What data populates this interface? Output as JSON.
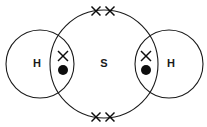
{
  "figure": {
    "molecule_formula": "H2S",
    "background_color": "#ffffff",
    "stroke_color": "#1a1a1a",
    "electron_color": "#0d0d0d",
    "width": 207,
    "height": 127
  },
  "atoms": [
    {
      "id": "hydrogen-left",
      "label": "H",
      "element": "H",
      "label_x": 37,
      "label_y": 63,
      "circle": {
        "cx": 40,
        "cy": 64,
        "r": 34
      }
    },
    {
      "id": "sulfur-center",
      "label": "S",
      "element": "S",
      "label_x": 104,
      "label_y": 63,
      "circle": {
        "cx": 104,
        "cy": 64,
        "r": 54
      }
    },
    {
      "id": "hydrogen-right",
      "label": "H",
      "element": "H",
      "label_x": 171,
      "label_y": 63,
      "circle": {
        "cx": 169,
        "cy": 64,
        "r": 34
      }
    }
  ],
  "electrons": {
    "crosses": [
      {
        "id": "cross-top-left",
        "x": 96,
        "y": 11,
        "size": 9,
        "owner": "sulfur",
        "position": "top-left"
      },
      {
        "id": "cross-top-right",
        "x": 110,
        "y": 11,
        "size": 9,
        "owner": "sulfur",
        "position": "top-right"
      },
      {
        "id": "cross-bottom-left",
        "x": 96,
        "y": 117,
        "size": 9,
        "owner": "sulfur",
        "position": "bottom-left"
      },
      {
        "id": "cross-bottom-right",
        "x": 110,
        "y": 117,
        "size": 9,
        "owner": "sulfur",
        "position": "bottom-right"
      },
      {
        "id": "cross-bond-left",
        "x": 63,
        "y": 56,
        "size": 10,
        "owner": "sulfur",
        "position": "left-bond"
      },
      {
        "id": "cross-bond-right",
        "x": 146,
        "y": 56,
        "size": 10,
        "owner": "sulfur",
        "position": "right-bond"
      }
    ],
    "dots": [
      {
        "id": "dot-bond-left",
        "x": 63,
        "y": 70,
        "r": 5,
        "owner": "hydrogen-left",
        "position": "left-bond"
      },
      {
        "id": "dot-bond-right",
        "x": 146,
        "y": 70,
        "r": 5,
        "owner": "hydrogen-right",
        "position": "right-bond"
      }
    ]
  },
  "legend": {
    "cross_meaning": "electron from sulfur",
    "dot_meaning": "electron from hydrogen",
    "bonding_pairs": 2,
    "lone_pairs": 2
  }
}
